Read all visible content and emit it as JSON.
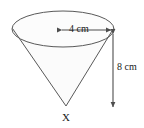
{
  "figure": {
    "name": "cone-with-dimensions",
    "shape": "cone",
    "apex_label": "X",
    "dimensions": {
      "diameter_label": "4 cm",
      "diameter_value": 4,
      "diameter_units": "cm",
      "height_label": "8 cm",
      "height_value": 8,
      "height_units": "cm"
    },
    "colors": {
      "outline": "#595959",
      "fill": "#fbfbfb",
      "arrow": "#4d4d4d",
      "text": "#1a1a1a",
      "background": "#ffffff"
    },
    "geometry": {
      "ellipse_cx": 63,
      "ellipse_cy": 29,
      "ellipse_rx": 51,
      "ellipse_ry": 18,
      "apex_x": 66,
      "apex_y": 106,
      "h_arrow_y": 30,
      "h_arrow_x1": 61,
      "h_arrow_x2": 112,
      "v_arrow_x": 113,
      "v_arrow_y1": 32,
      "v_arrow_y2": 109
    }
  }
}
